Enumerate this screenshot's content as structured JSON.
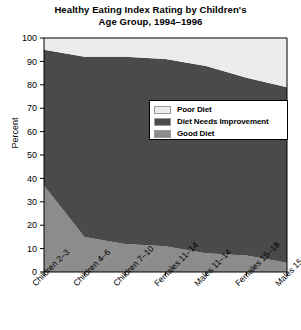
{
  "chart_data": {
    "type": "area",
    "title": "Healthy Eating Index Rating by Children's Age Group, 1994–1996",
    "title_line1": "Healthy Eating Index Rating by Children's",
    "title_line2": "Age Group, 1994–1996",
    "xlabel": "",
    "ylabel": "Percent",
    "ylim": [
      0,
      100
    ],
    "yticks": [
      0,
      10,
      20,
      30,
      40,
      50,
      60,
      70,
      80,
      90,
      100
    ],
    "grid": false,
    "legend_position": "center-right",
    "stacked": true,
    "categories": [
      "Children 2–3",
      "Children 4–6",
      "Children 7–10",
      "Females 11–14",
      "Males 11–14",
      "Females 15–18",
      "Males 15–18"
    ],
    "series": [
      {
        "name": "Good Diet",
        "color": "#8c8c8c",
        "values": [
          37,
          15,
          12,
          11,
          8,
          7,
          4
        ]
      },
      {
        "name": "Diet Needs Improvement",
        "color": "#4a4a4a",
        "values": [
          58,
          77,
          80,
          80,
          80,
          76,
          75
        ]
      },
      {
        "name": "Poor Diet",
        "color": "#ececec",
        "values": [
          5,
          8,
          8,
          9,
          12,
          17,
          21
        ]
      }
    ],
    "cumulative_top_boundaries": {
      "good_diet_top": [
        37,
        15,
        12,
        11,
        8,
        7,
        4
      ],
      "needs_improvement_top": [
        95,
        92,
        92,
        91,
        88,
        83,
        79
      ]
    },
    "legend": [
      {
        "label": "Poor Diet",
        "color": "#ececec"
      },
      {
        "label": "Diet Needs Improvement",
        "color": "#4a4a4a"
      },
      {
        "label": "Good Diet",
        "color": "#8c8c8c"
      }
    ]
  },
  "axes": {
    "y_axis_label": "Percent"
  }
}
